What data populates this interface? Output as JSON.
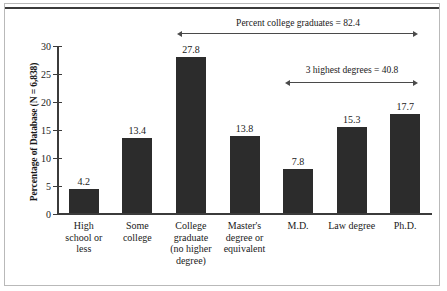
{
  "chart_data": {
    "type": "bar",
    "title": "",
    "xlabel": "",
    "ylabel": "Percentage of Database (N = 6,838)",
    "ylim": [
      0,
      30
    ],
    "yticks": [
      "0",
      "5",
      "10",
      "15",
      "20",
      "25",
      "30"
    ],
    "grid": false,
    "legend": "none",
    "bar_color": "#2c2c2c",
    "categories": [
      "High school or less",
      "Some college",
      "College graduate (no higher degree)",
      "Master's degree or equivalent",
      "M.D.",
      "Law degree",
      "Ph.D."
    ],
    "category_lines": [
      [
        "High",
        "school or",
        "less"
      ],
      [
        "Some",
        "college"
      ],
      [
        "College",
        "graduate",
        "(no higher",
        "degree)"
      ],
      [
        "Master's",
        "degree or",
        "equivalent"
      ],
      [
        "M.D."
      ],
      [
        "Law degree"
      ],
      [
        "Ph.D."
      ]
    ],
    "values": [
      4.2,
      13.4,
      27.8,
      13.8,
      7.8,
      15.3,
      17.7
    ],
    "value_labels": [
      "4.2",
      "13.4",
      "27.8",
      "13.8",
      "7.8",
      "15.3",
      "17.7"
    ],
    "annotations": [
      {
        "text": "Percent college graduates = 82.4",
        "value": 82.4,
        "spans_categories": [
          "College graduate (no higher degree)",
          "Ph.D."
        ]
      },
      {
        "text": "3 highest degrees = 40.8",
        "value": 40.8,
        "spans_categories": [
          "M.D.",
          "Ph.D."
        ]
      }
    ]
  }
}
